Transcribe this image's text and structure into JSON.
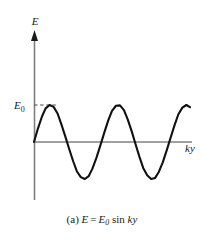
{
  "figure": {
    "caption_prefix": "(a)",
    "caption_expr_lhs": "E",
    "caption_equals": "=",
    "caption_amp": "E",
    "caption_amp_sub": "0",
    "caption_fn": "sin",
    "caption_arg": "ky",
    "vertical_axis_label": "E",
    "horizontal_axis_label": "ky",
    "amplitude_label": "E",
    "amplitude_label_sub": "0",
    "colors": {
      "axis": "#808080",
      "curve": "#111111",
      "dashed": "#4d4d4d",
      "background": "#ffffff",
      "text": "#1a1a1a"
    }
  },
  "chart_data": {
    "type": "line",
    "title": "",
    "subtitle": "",
    "xlabel": "ky",
    "ylabel": "E",
    "function": "E = E0 sin(ky)",
    "amplitude": 1,
    "amplitude_label": "E0",
    "periods_shown": 2.35,
    "xlim": [
      0,
      4.7
    ],
    "ylim": [
      -1.25,
      1.25
    ],
    "grid": false,
    "legend": false,
    "annotations": [
      {
        "text": "E0",
        "type": "amplitude-marker",
        "y": 1,
        "dashed_guide": true
      }
    ],
    "x_units": "radians/pi",
    "x": [
      0.0,
      0.12,
      0.24,
      0.35,
      0.47,
      0.59,
      0.71,
      0.82,
      0.94,
      1.06,
      1.18,
      1.29,
      1.41,
      1.53,
      1.65,
      1.76,
      1.88,
      2.0,
      2.12,
      2.24,
      2.35,
      2.47,
      2.59,
      2.71,
      2.82,
      2.94,
      3.06,
      3.18,
      3.29,
      3.41,
      3.53,
      3.65,
      3.76,
      3.88,
      4.0,
      4.12,
      4.24,
      4.35,
      4.47,
      4.59,
      4.7
    ],
    "y": [
      0.0,
      0.37,
      0.69,
      0.91,
      1.0,
      0.95,
      0.77,
      0.49,
      0.16,
      -0.19,
      -0.52,
      -0.79,
      -0.95,
      -1.0,
      -0.92,
      -0.72,
      -0.43,
      -0.09,
      0.26,
      0.59,
      0.84,
      0.98,
      0.99,
      0.86,
      0.62,
      0.3,
      -0.06,
      -0.41,
      -0.7,
      -0.9,
      -1.0,
      -0.97,
      -0.81,
      -0.55,
      -0.22,
      0.13,
      0.47,
      0.75,
      0.93,
      1.0,
      0.94
    ],
    "series": [
      {
        "name": "E = E0 sin ky",
        "color": "#111111",
        "values": [
          0.0,
          0.37,
          0.69,
          0.91,
          1.0,
          0.95,
          0.77,
          0.49,
          0.16,
          -0.19,
          -0.52,
          -0.79,
          -0.95,
          -1.0,
          -0.92,
          -0.72,
          -0.43,
          -0.09,
          0.26,
          0.59,
          0.84,
          0.98,
          0.99,
          0.86,
          0.62,
          0.3,
          -0.06,
          -0.41,
          -0.7,
          -0.9,
          -1.0,
          -0.97,
          -0.81,
          -0.55,
          -0.22,
          0.13,
          0.47,
          0.75,
          0.93,
          1.0,
          0.94
        ]
      }
    ]
  }
}
